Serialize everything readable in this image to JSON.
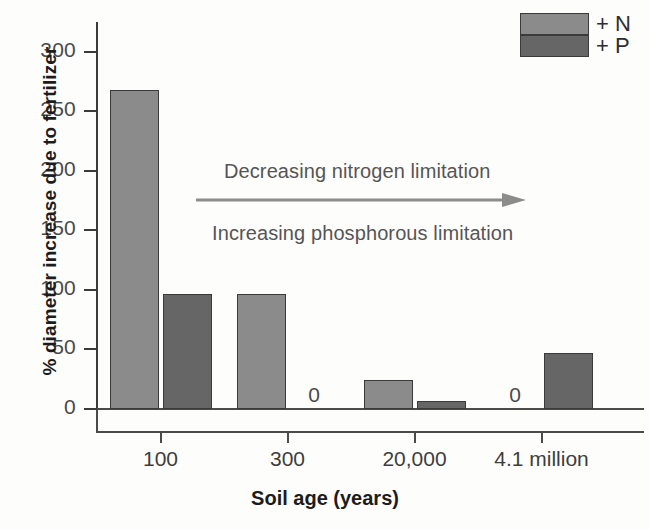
{
  "chart_data": {
    "type": "bar",
    "title": "",
    "xlabel": "Soil age (years)",
    "ylabel": "% diameter increase due to fertilizer",
    "categories": [
      "100",
      "300",
      "20,000",
      "4.1 million"
    ],
    "series": [
      {
        "name": "+ N",
        "color": "#8b8b8b",
        "values": [
          268,
          97,
          24,
          0
        ]
      },
      {
        "name": "+ P",
        "color": "#666666",
        "values": [
          97,
          0,
          7,
          47
        ]
      }
    ],
    "ylim": [
      0,
      310
    ],
    "yticks": [
      0,
      50,
      100,
      150,
      200,
      250,
      300
    ],
    "ytick_labels": [
      "0",
      "50",
      "100",
      "150",
      "200",
      "250",
      "300"
    ],
    "grid": false,
    "legend_position": "top-right",
    "zero_labels": [
      {
        "series": "+ P",
        "category": "300",
        "text": "0"
      },
      {
        "series": "+ N",
        "category": "4.1 million",
        "text": "0"
      }
    ],
    "annotations": [
      {
        "name": "decreasing-nitrogen",
        "text": "Decreasing nitrogen limitation"
      },
      {
        "name": "increasing-phosphorous",
        "text": "Increasing phosphorous limitation"
      },
      {
        "name": "trend-arrow",
        "direction": "right",
        "color": "#8c8c8c"
      }
    ]
  },
  "legend": {
    "items": [
      {
        "label": "+ N",
        "color": "#8b8b8b"
      },
      {
        "label": "+ P",
        "color": "#666666"
      }
    ]
  },
  "axes": {
    "y_title": "% diameter increase due to fertilizer",
    "x_title": "Soil age (years)"
  }
}
